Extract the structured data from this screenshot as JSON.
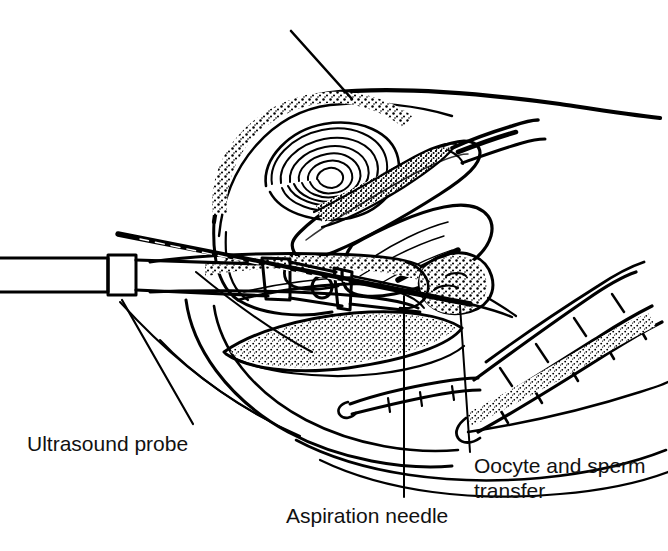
{
  "figure": {
    "type": "medical-line-illustration",
    "view": "midsagittal section of female pelvis",
    "background_color": "#ffffff",
    "ink_color": "#000000",
    "width": 668,
    "height": 551
  },
  "labels": {
    "ultrasound_probe": "Ultrasound probe",
    "aspiration_needle": "Aspiration needle",
    "oocyte_transfer": "Oocyte and sperm\ntransfer",
    "oocyte_transfer_line1": "Oocyte and sperm",
    "oocyte_transfer_line2": "transfer"
  },
  "structures": [
    {
      "name": "abdominal-wall-outline",
      "description": "long sweeping arc across upper right"
    },
    {
      "name": "bladder",
      "description": "large oval body, stippled superior border"
    },
    {
      "name": "uterine-cavity",
      "description": "concentric spiral whorl inside uterine body"
    },
    {
      "name": "uterus-myometrium",
      "description": "ovoid organ with endometrial stippled stripe"
    },
    {
      "name": "fallopian-tube",
      "description": "tapering tube extending to upper right"
    },
    {
      "name": "ovary",
      "description": "rounded stippled mass at right of uterus"
    },
    {
      "name": "cervix-vagina",
      "description": "canal running left from uterus to probe"
    },
    {
      "name": "rectum",
      "description": "stippled elongated organ below vagina"
    },
    {
      "name": "ultrasound-probe",
      "description": "cylindrical transducer inserted from left"
    },
    {
      "name": "aspiration-needle",
      "description": "fine needle along probe axis toward ovary"
    },
    {
      "name": "transfer-catheter",
      "description": "segmented catheter held by fingers lower right"
    },
    {
      "name": "fingers",
      "description": "gloved fingers holding catheter at lower right"
    }
  ],
  "leader_lines": [
    {
      "name": "leader-ultrasound-probe",
      "from": [
        193,
        424
      ],
      "to": [
        122,
        300
      ]
    },
    {
      "name": "leader-aspiration-needle",
      "from": [
        404,
        497
      ],
      "to": [
        404,
        296
      ]
    },
    {
      "name": "leader-oocyte-transfer",
      "from": [
        470,
        455
      ],
      "to": [
        460,
        306
      ]
    },
    {
      "name": "leader-top-bladder",
      "from": [
        292,
        31
      ],
      "to": [
        352,
        99
      ]
    }
  ]
}
